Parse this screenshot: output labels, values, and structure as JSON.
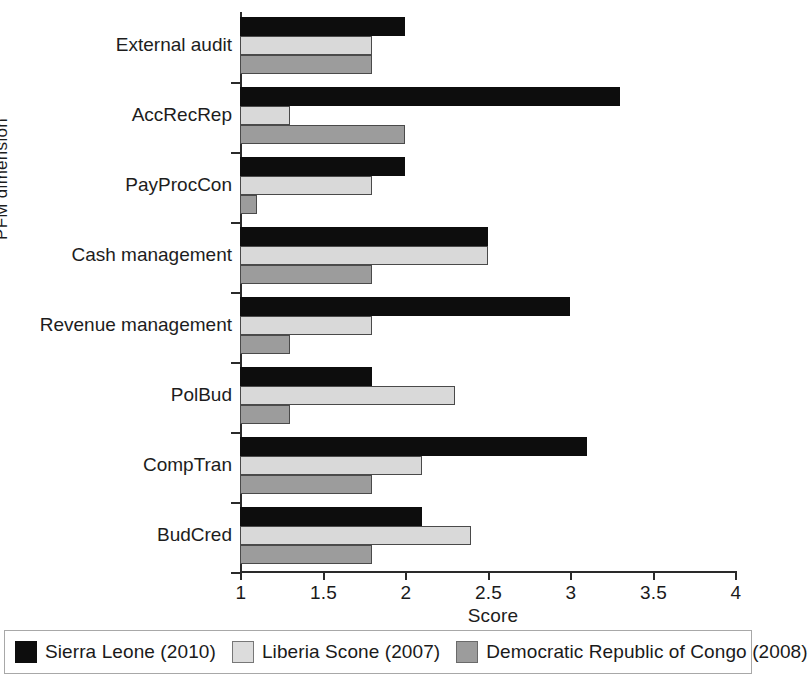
{
  "chart_data": {
    "type": "bar",
    "orientation": "horizontal",
    "title": "",
    "xlabel": "Score",
    "ylabel": "PFM dimension",
    "xlim": [
      1,
      4
    ],
    "xticks": [
      "1",
      "1.5",
      "2",
      "2.5",
      "3",
      "3.5",
      "4"
    ],
    "xtick_values": [
      1,
      1.5,
      2,
      2.5,
      3,
      3.5,
      4
    ],
    "grid": false,
    "legend_position": "bottom",
    "categories": [
      "External audit",
      "AccRecRep",
      "PayProcCon",
      "Cash management",
      "Revenue management",
      "PolBud",
      "CompTran",
      "BudCred"
    ],
    "series": [
      {
        "name": "Sierra Leone (2010)",
        "color": "#0d0d0d",
        "values": [
          2.0,
          3.3,
          2.0,
          2.5,
          3.0,
          1.8,
          3.1,
          2.1
        ]
      },
      {
        "name": "Liberia Scone (2007)",
        "color": "#d9d9d9",
        "values": [
          1.8,
          1.3,
          1.8,
          2.5,
          1.8,
          2.3,
          2.1,
          2.4
        ]
      },
      {
        "name": "Democratic Republic of Congo (2008)",
        "color": "#9c9c9c",
        "values": [
          1.8,
          2.0,
          1.1,
          1.8,
          1.3,
          1.3,
          1.8,
          1.8
        ]
      }
    ]
  },
  "legend": {
    "entries": [
      {
        "label": "Sierra Leone (2010)"
      },
      {
        "label": "Liberia Scone (2007)"
      },
      {
        "label": "Democratic Republic of Congo (2008)"
      }
    ]
  }
}
